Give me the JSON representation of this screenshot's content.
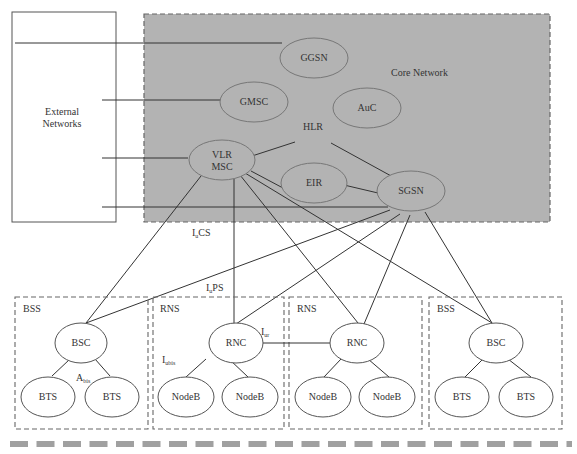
{
  "diagram": {
    "external": {
      "label_line1": "External",
      "label_line2": "Networks"
    },
    "core": {
      "title": "Core Network",
      "nodes": {
        "ggsn": "GGSN",
        "gmsc": "GMSC",
        "auc": "AuC",
        "hlr": "HLR",
        "vlr": "VLR",
        "msc": "MSC",
        "eir": "EIR",
        "sgsn": "SGSN"
      },
      "fill": "#b0b0b0"
    },
    "interfaces": {
      "iu_cs": {
        "main": "I",
        "sub": "u",
        "rest": "CS"
      },
      "iu_ps": {
        "main": "I",
        "sub": "u",
        "rest": "PS"
      },
      "iur": {
        "main": "I",
        "sub": "ur"
      },
      "iubis": {
        "main": "I",
        "sub": "ubis"
      },
      "abis": {
        "main": "A",
        "sub": "bis"
      }
    },
    "subsystems": [
      {
        "type": "BSS",
        "controller": "BSC",
        "stations": [
          "BTS",
          "BTS"
        ]
      },
      {
        "type": "RNS",
        "controller": "RNC",
        "stations": [
          "NodeB",
          "NodeB"
        ]
      },
      {
        "type": "RNS",
        "controller": "RNC",
        "stations": [
          "NodeB",
          "NodeB"
        ]
      },
      {
        "type": "BSS",
        "controller": "BSC",
        "stations": [
          "BTS",
          "BTS"
        ]
      }
    ],
    "footer_bar_color": "#a0a0a0"
  }
}
